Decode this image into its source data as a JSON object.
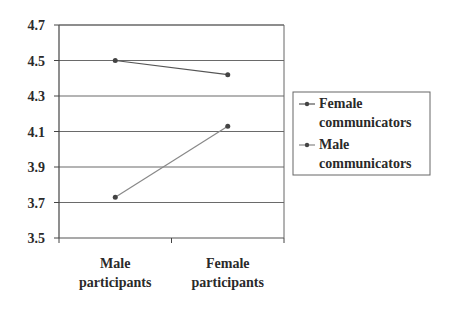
{
  "chart_data": {
    "type": "line",
    "title": "",
    "xlabel": "",
    "ylabel": "",
    "categories": [
      "Male participants",
      "Female participants"
    ],
    "category_lines": [
      [
        "Male",
        "participants"
      ],
      [
        "Female",
        "participants"
      ]
    ],
    "ylim": [
      3.5,
      4.7
    ],
    "yticks": [
      "3.5",
      "3.7",
      "3.9",
      "4.1",
      "4.3",
      "4.5",
      "4.7"
    ],
    "ytick_values": [
      3.5,
      3.7,
      3.9,
      4.1,
      4.3,
      4.5,
      4.7
    ],
    "grid": true,
    "legend_position": "right",
    "series": [
      {
        "name": "Female communicators",
        "name_lines": [
          "Female",
          "communicators"
        ],
        "values": [
          4.5,
          4.42
        ],
        "color": "#555555"
      },
      {
        "name": "Male communicators",
        "name_lines": [
          "Male",
          "communicators"
        ],
        "values": [
          3.73,
          4.13
        ],
        "color": "#888888"
      }
    ]
  }
}
